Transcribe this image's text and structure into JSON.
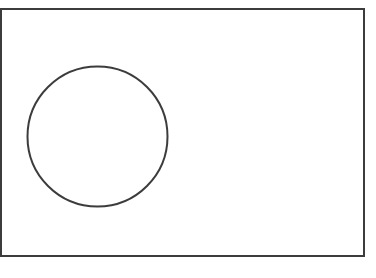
{
  "canvas": {
    "width": 376,
    "height": 278,
    "background": "#ffffff"
  },
  "stroke": {
    "color": "#3c3c3c",
    "width": 2
  },
  "shapes": {
    "rectangle": {
      "x": 1,
      "y": 9,
      "width": 363,
      "height": 247
    },
    "circle": {
      "cx": 97.5,
      "cy": 136.5,
      "r": 70
    }
  }
}
